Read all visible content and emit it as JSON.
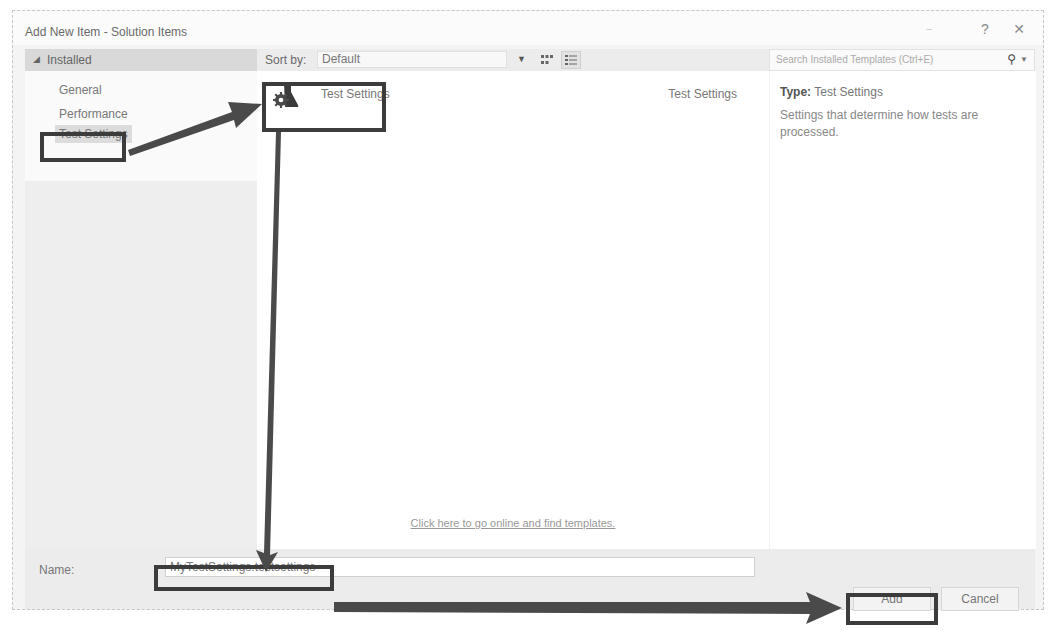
{
  "dialog": {
    "title": "Add New Item - Solution Items",
    "title_buttons": {
      "minimize": "–",
      "help": "?",
      "close": "✕"
    }
  },
  "left_pane": {
    "header": "Installed",
    "header_icon": "triangle-expanded-icon",
    "items": [
      {
        "label": "General",
        "selected": false
      },
      {
        "label": "Performance",
        "selected": false
      },
      {
        "label": "Test Settings",
        "selected": true
      }
    ]
  },
  "toolbar": {
    "sort_label": "Sort by:",
    "sort_value": "Default",
    "view_buttons": [
      "grid-view-icon",
      "list-view-icon"
    ]
  },
  "search": {
    "placeholder": "Search Installed Templates (Ctrl+E)",
    "icon": "search-icon"
  },
  "templates": [
    {
      "name": "Test Settings",
      "type": "Test Settings",
      "icon": "flask-gear-icon",
      "selected": true
    }
  ],
  "online_link": "Click here to go online and find templates.",
  "details": {
    "type_label": "Type:",
    "type_value": "Test Settings",
    "description": "Settings that determine how tests are processed."
  },
  "bottom": {
    "name_label": "Name:",
    "name_value": "MyTestSettings.testsettings",
    "add_label": "Add",
    "cancel_label": "Cancel"
  },
  "annotations": {
    "box_color": "#3c3c3c",
    "arrow_color": "#4a4a4a"
  }
}
